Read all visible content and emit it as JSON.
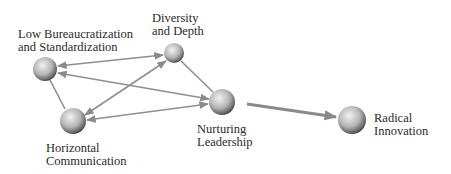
{
  "diagram": {
    "type": "network",
    "nodes": [
      {
        "id": "low_bureaucratization",
        "lines": [
          "Low Bureaucratization",
          "and Standardization"
        ],
        "cx": 45,
        "cy": 69,
        "r": 12
      },
      {
        "id": "diversity_depth",
        "lines": [
          "Diversity",
          "and Depth"
        ],
        "cx": 174,
        "cy": 53,
        "r": 10
      },
      {
        "id": "horizontal_communication",
        "lines": [
          "Horizontal",
          "Communication"
        ],
        "cx": 73,
        "cy": 121,
        "r": 13
      },
      {
        "id": "nurturing_leadership",
        "lines": [
          "Nurturing",
          "Leadership"
        ],
        "cx": 222,
        "cy": 102,
        "r": 13
      },
      {
        "id": "radical_innovation",
        "lines": [
          "Radical",
          "Innovation"
        ],
        "cx": 352,
        "cy": 120,
        "r": 14
      }
    ],
    "edges": [
      {
        "from": "low_bureaucratization",
        "to": "diversity_depth",
        "direction": "both"
      },
      {
        "from": "low_bureaucratization",
        "to": "nurturing_leadership",
        "direction": "both"
      },
      {
        "from": "low_bureaucratization",
        "to": "horizontal_communication",
        "direction": "none"
      },
      {
        "from": "diversity_depth",
        "to": "horizontal_communication",
        "direction": "both"
      },
      {
        "from": "diversity_depth",
        "to": "nurturing_leadership",
        "direction": "none"
      },
      {
        "from": "horizontal_communication",
        "to": "nurturing_leadership",
        "direction": "both"
      },
      {
        "from": "nurturing_leadership",
        "to": "radical_innovation",
        "direction": "forward",
        "emphasis": "thick"
      }
    ],
    "colors": {
      "node_light": "#e6e6e6",
      "node_dark": "#3a3a3a",
      "edge": "#8a8a8a",
      "text": "#2a2a2a"
    }
  }
}
